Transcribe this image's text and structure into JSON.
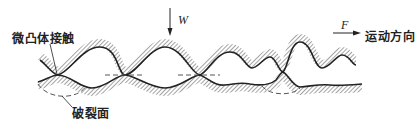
{
  "diagram": {
    "labels": {
      "asperity_contact": "微凸体接触",
      "fracture_surface": "破裂面",
      "load": "W",
      "force": "F",
      "motion_direction": "运动方向"
    },
    "colors": {
      "line": "#222222",
      "hatch": "#555555",
      "dashed": "#555555",
      "background": "#ffffff"
    },
    "upper_surface_path": "M40,60 C48,66 52,74 58,75 C70,72 82,47 100,47 C118,47 118,75 125,75 C135,75 150,47 165,47 C182,47 192,75 200,75 C208,72 216,52 230,52 C242,52 246,68 252,68 C258,68 264,57 270,57 C276,57 279,72 283,72 C288,68 290,42 300,42 C312,42 314,68 322,68 C330,68 336,55 342,55 C350,55 352,65 356,65",
    "lower_surface_path": "M38,82 C46,80 52,75 58,75 C70,75 80,88 92,88 C106,88 116,75 125,75 C134,75 150,88 165,88 C180,88 192,75 200,75 C208,78 214,86 224,85 C236,84 240,82 250,84 C262,86 270,85 276,80 C279,76 281,72 283,72 C288,74 292,86 300,87 C312,86 320,84 330,85 C340,86 350,85 362,84",
    "dashed_midlines": [
      {
        "x1": 105,
        "y1": 75,
        "x2": 145,
        "y2": 75
      },
      {
        "x1": 178,
        "y1": 75,
        "x2": 220,
        "y2": 75
      }
    ],
    "fracture_arcs": [
      "M38,84 C48,100 78,100 86,86",
      "M262,86 C270,96 292,96 300,88"
    ]
  }
}
